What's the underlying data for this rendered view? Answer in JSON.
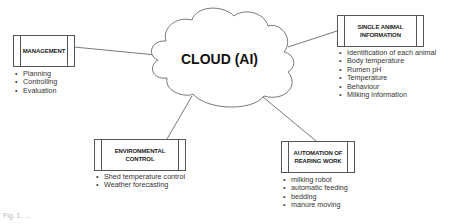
{
  "center": {
    "label": "CLOUD (AI)"
  },
  "nodes": {
    "management": {
      "title_lines": [
        "MANAGEMENT"
      ],
      "items": [
        "Planning",
        "Controlling",
        "Evaluation"
      ]
    },
    "single_animal": {
      "title_lines": [
        "SINGLE ANIMAL",
        "INFORMATION"
      ],
      "items": [
        "Identification of each animal",
        "Body temperature",
        "Rumen pH",
        "Temperature",
        "Behaviour",
        "Milking information"
      ]
    },
    "environmental": {
      "title_lines": [
        "ENVIRONMENTAL",
        "CONTROL"
      ],
      "items": [
        "Shed temperature control",
        "Weather forecasting"
      ]
    },
    "automation": {
      "title_lines": [
        "AUTOMATION OF",
        "REARING WORK"
      ],
      "items": [
        "milking robot",
        "automatic feeding",
        "bedding",
        "manure moving"
      ]
    }
  },
  "caption": "Fig. 1. ..."
}
